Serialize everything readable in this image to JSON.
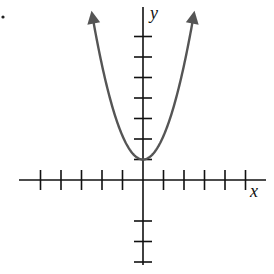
{
  "chart_data": {
    "type": "line",
    "title": "",
    "xlabel": "x",
    "ylabel": "y",
    "function": "y = x^2 + 1",
    "vertex": [
      0,
      1
    ],
    "xlim": [
      -6,
      6
    ],
    "ylim": [
      -6,
      8
    ],
    "x_ticks": [
      -5,
      -4,
      -3,
      -2,
      -1,
      1,
      2,
      3,
      4,
      5
    ],
    "y_ticks": [
      -4,
      -3,
      -2,
      1,
      2,
      3,
      4,
      5,
      6,
      7
    ],
    "tick_labels_shown": false,
    "grid": false,
    "arrows_on_curve_ends": true,
    "series": [
      {
        "name": "parabola",
        "color": "#555555",
        "points": [
          [
            -2.5,
            7.25
          ],
          [
            -2,
            5
          ],
          [
            -1,
            2
          ],
          [
            0,
            1
          ],
          [
            1,
            2
          ],
          [
            2,
            5
          ],
          [
            2.5,
            7.25
          ]
        ]
      }
    ]
  },
  "labels": {
    "x_axis": "x",
    "y_axis": "y"
  },
  "colors": {
    "axes": "#111111",
    "curve": "#555555",
    "background": "#ffffff"
  },
  "layout": {
    "origin_px": [
      143,
      180
    ],
    "unit_px": 20.5,
    "x_axis_px": [
      19,
      266
    ],
    "y_axis_px": [
      7,
      265
    ],
    "marker_dot_px": [
      3,
      17
    ]
  }
}
